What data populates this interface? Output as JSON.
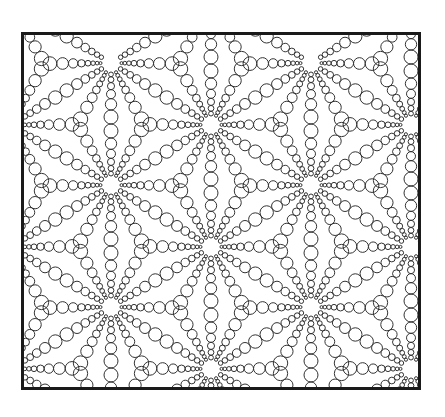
{
  "figure": {
    "stroke_color": "#333333",
    "frame_color": "#1a1a1a",
    "background": "#ffffff"
  },
  "pattern": {
    "hub_spacing_x": 100,
    "hub_spacing_y": 122,
    "hub_offset_y_odd_columns": 60,
    "first_hub": [
      -13,
      90
    ],
    "columns": 7,
    "rows": 5,
    "edge_chain_radii": [
      1.8,
      2.2,
      2.7,
      3.4,
      4.3,
      5.3,
      5.3,
      4.3,
      3.4,
      2.7,
      2.2,
      1.8
    ],
    "centroid_chain_radii": [
      1.8,
      2.2,
      2.7,
      3.4,
      4.4,
      5.6,
      7.0,
      8.2
    ]
  }
}
